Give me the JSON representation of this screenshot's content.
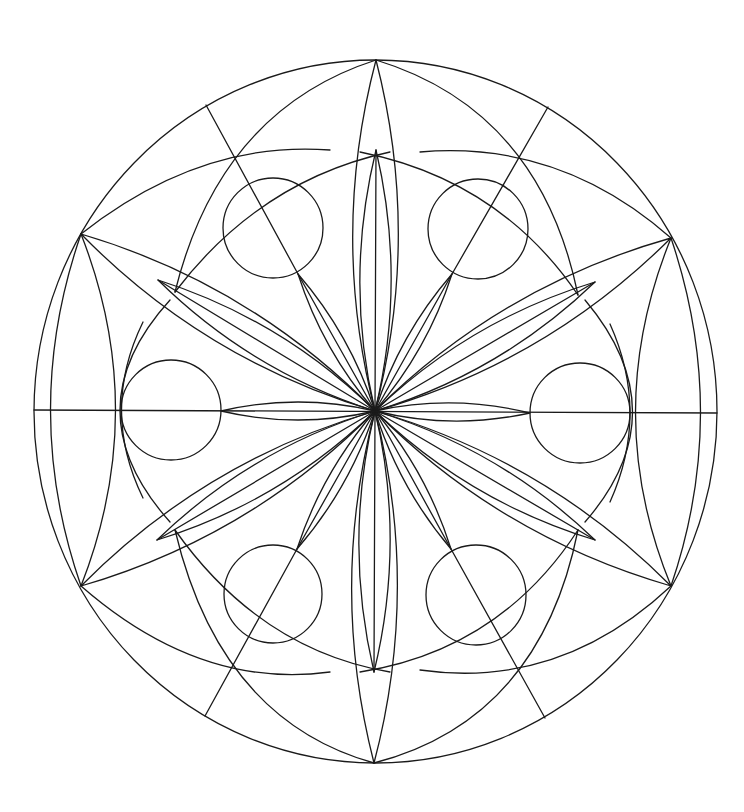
{
  "artwork": {
    "title": "",
    "type": "mandala-line-art",
    "background": "#ffffff",
    "stroke": "#1a1a1a",
    "center": [
      375,
      411
    ],
    "outer_ellipse": {
      "cx": 375.5,
      "cy": 411.5,
      "rx": 341.5,
      "ry": 351.5
    },
    "outer_points": [
      [
        376,
        60
      ],
      [
        671,
        238
      ],
      [
        717,
        413
      ],
      [
        671,
        586
      ],
      [
        374,
        763
      ],
      [
        81,
        586
      ],
      [
        34,
        410
      ],
      [
        81,
        234
      ]
    ],
    "inner_tips": [
      [
        376,
        150
      ],
      [
        595,
        282
      ],
      [
        595,
        540
      ],
      [
        374,
        672
      ],
      [
        157,
        540
      ],
      [
        158,
        280
      ]
    ],
    "circles": [
      {
        "cx": 273,
        "cy": 228,
        "r": 50
      },
      {
        "cx": 478,
        "cy": 229,
        "r": 50
      },
      {
        "cx": 171,
        "cy": 410,
        "r": 50
      },
      {
        "cx": 580,
        "cy": 413,
        "r": 50
      },
      {
        "cx": 273,
        "cy": 594,
        "r": 49
      },
      {
        "cx": 476,
        "cy": 595,
        "r": 50
      }
    ],
    "diagonals": [
      [
        [
          206,
          105
        ],
        [
          298,
          274
        ]
      ],
      [
        [
          548,
          107
        ],
        [
          452,
          274
        ]
      ],
      [
        [
          297,
          549
        ],
        [
          205,
          716
        ]
      ],
      [
        [
          451,
          549
        ],
        [
          545,
          718
        ]
      ]
    ],
    "axes": [
      [
        [
          34,
          410
        ],
        [
          717,
          413
        ]
      ],
      [
        [
          376,
          150
        ],
        [
          374,
          672
        ]
      ]
    ]
  }
}
